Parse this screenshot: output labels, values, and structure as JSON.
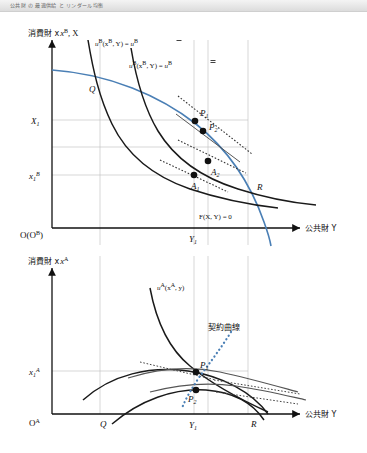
{
  "header": {
    "strip_text": "公共財 の 最適供給 と リンダール均衡"
  },
  "figure": {
    "accent_blue": "#4a7fb5",
    "curve_black": "#1a1a1a",
    "curve_gray": "#555555",
    "grid_gray": "#b8b8b8",
    "dotted_blue": "#4a7fb5",
    "upper_panel": {
      "y_axis_label": "消費財 x",
      "y_axis_label_sup": "B",
      "y_axis_label_tail": ", X",
      "x_axis_label": "公共財 Y",
      "origin_label": "O(O",
      "origin_label_sup": "B",
      "origin_label_tail": ")",
      "y_ticks": [
        {
          "id": "X1",
          "base": "X",
          "sub": "1",
          "sup": ""
        },
        {
          "id": "x1B",
          "base": "x",
          "sub": "1",
          "sup": "B"
        }
      ],
      "x_ticks": [
        {
          "id": "Y1",
          "base": "Y",
          "sub": "1"
        }
      ],
      "curve_labels": [
        {
          "id": "uB-upper",
          "text": "u",
          "sup": "B",
          "args": "(x",
          "args_sup": "B",
          "args_tail": ", Y) = ",
          "rhs": "u",
          "rhs_sup": "B",
          "rhs_bar": "single"
        },
        {
          "id": "uB-lower",
          "text": "u",
          "sup": "B",
          "args": "(x",
          "args_sup": "B",
          "args_tail": ", Y) = ",
          "rhs": "u",
          "rhs_sup": "B",
          "rhs_bar": "double"
        }
      ],
      "ppf_label": "F(X, Y) = 0",
      "points": [
        {
          "id": "P1",
          "base": "P",
          "sub": "1"
        },
        {
          "id": "P2",
          "base": "P",
          "sub": "2"
        },
        {
          "id": "A1",
          "base": "A",
          "sub": "1"
        },
        {
          "id": "A2",
          "base": "A",
          "sub": "2"
        },
        {
          "id": "Q",
          "base": "Q",
          "sub": ""
        },
        {
          "id": "R",
          "base": "R",
          "sub": ""
        }
      ]
    },
    "lower_panel": {
      "y_axis_label": "消費財 x",
      "y_axis_label_sup": "A",
      "x_axis_label": "公共財 Y",
      "origin_label": "O",
      "origin_label_sup": "A",
      "y_ticks": [
        {
          "id": "x1A",
          "base": "x",
          "sub": "1",
          "sup": "A"
        }
      ],
      "x_ticks": [
        {
          "id": "Y1",
          "base": "Y",
          "sub": "1"
        }
      ],
      "curve_labels": [
        {
          "id": "uA",
          "text": "u",
          "sup": "A",
          "args": "(x",
          "args_sup": "A",
          "args_tail": ", y)"
        }
      ],
      "contract_curve_label": "契約曲線",
      "points": [
        {
          "id": "P1",
          "base": "P",
          "sub": "1"
        },
        {
          "id": "P2",
          "base": "P",
          "sub": "2"
        },
        {
          "id": "Q",
          "base": "Q",
          "sub": ""
        },
        {
          "id": "R",
          "base": "R",
          "sub": ""
        }
      ]
    }
  }
}
